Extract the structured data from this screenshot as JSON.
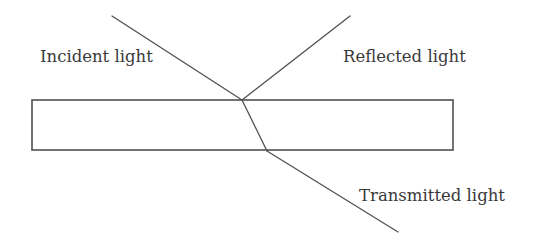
{
  "diagram": {
    "labels": {
      "incident": "Incident light",
      "reflected": "Reflected light",
      "transmitted": "Transmitted light"
    },
    "colors": {
      "line": "#505050",
      "text": "#3a3a3a",
      "background": "#ffffff"
    }
  }
}
